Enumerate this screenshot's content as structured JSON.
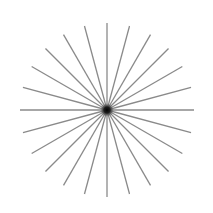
{
  "figure": {
    "type": "starburst",
    "spoke_count": 24,
    "angle_step_deg": 15,
    "center": [
      107,
      110
    ],
    "radius": 87,
    "line_color": "#8a8a8a",
    "line_width": 1.3,
    "center_dot_color": "#111111",
    "background": "#ffffff"
  }
}
